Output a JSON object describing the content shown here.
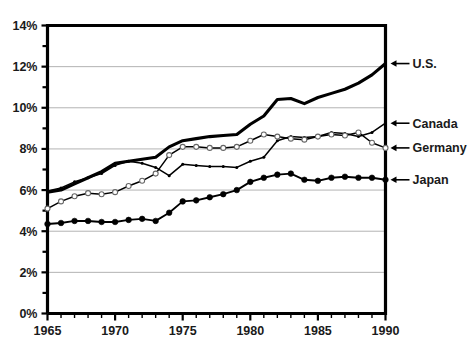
{
  "chart_data": {
    "type": "line",
    "title": "",
    "xlabel": "",
    "ylabel": "",
    "xlim": [
      1965,
      1990
    ],
    "ylim": [
      0,
      14
    ],
    "grid": true,
    "grid_axis": "y",
    "legend_position": "right-inline-callouts",
    "y_tick_labels": [
      "0%",
      "2%",
      "4%",
      "6%",
      "8%",
      "10%",
      "12%",
      "14%"
    ],
    "y_tick_values": [
      0,
      2,
      4,
      6,
      8,
      10,
      12,
      14
    ],
    "y_minor_tick_values": [
      1,
      3,
      5,
      7,
      9,
      11,
      13
    ],
    "x_tick_labels": [
      "1965",
      "1970",
      "1975",
      "1980",
      "1985",
      "1990"
    ],
    "x_tick_values": [
      1965,
      1970,
      1975,
      1980,
      1985,
      1990
    ],
    "x": [
      1965,
      1966,
      1967,
      1968,
      1969,
      1970,
      1971,
      1972,
      1973,
      1974,
      1975,
      1976,
      1977,
      1978,
      1979,
      1980,
      1981,
      1982,
      1983,
      1984,
      1985,
      1986,
      1987,
      1988,
      1989,
      1990
    ],
    "series": [
      {
        "name": "U.S.",
        "marker": "none",
        "values": [
          5.9,
          6.0,
          6.3,
          6.6,
          6.9,
          7.3,
          7.4,
          7.5,
          7.6,
          8.1,
          8.4,
          8.5,
          8.6,
          8.65,
          8.7,
          9.2,
          9.6,
          10.4,
          10.45,
          10.2,
          10.5,
          10.7,
          10.9,
          11.2,
          11.6,
          12.15
        ]
      },
      {
        "name": "Canada",
        "marker": "small-dot",
        "values": [
          5.95,
          6.1,
          6.4,
          6.6,
          6.8,
          7.2,
          7.4,
          7.3,
          7.1,
          6.7,
          7.25,
          7.2,
          7.15,
          7.15,
          7.1,
          7.4,
          7.6,
          8.4,
          8.6,
          8.55,
          8.6,
          8.8,
          8.75,
          8.6,
          8.8,
          9.25
        ]
      },
      {
        "name": "Germany",
        "marker": "open-circle",
        "values": [
          5.1,
          5.45,
          5.7,
          5.85,
          5.8,
          5.9,
          6.2,
          6.45,
          6.8,
          7.7,
          8.1,
          8.1,
          8.05,
          8.05,
          8.1,
          8.4,
          8.7,
          8.6,
          8.5,
          8.45,
          8.6,
          8.7,
          8.65,
          8.8,
          8.3,
          8.05
        ]
      },
      {
        "name": "Japan",
        "marker": "dot",
        "values": [
          4.35,
          4.4,
          4.5,
          4.5,
          4.45,
          4.45,
          4.55,
          4.6,
          4.5,
          4.9,
          5.45,
          5.5,
          5.65,
          5.8,
          6.0,
          6.4,
          6.6,
          6.75,
          6.8,
          6.5,
          6.45,
          6.6,
          6.65,
          6.6,
          6.6,
          6.5
        ]
      }
    ]
  },
  "callouts": [
    {
      "label": "U.S.",
      "value": 12.15
    },
    {
      "label": "Canada",
      "value": 9.25
    },
    {
      "label": "Germany",
      "value": 8.05
    },
    {
      "label": "Japan",
      "value": 6.5
    }
  ]
}
